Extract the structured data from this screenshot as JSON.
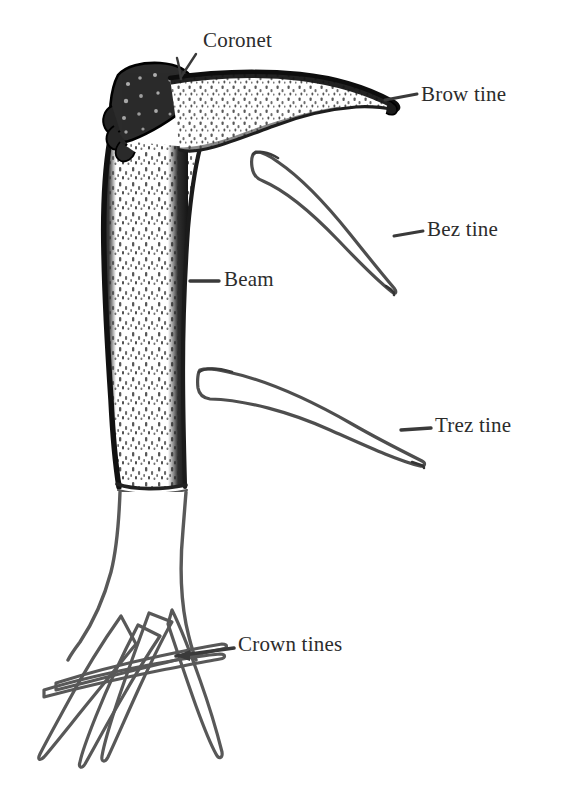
{
  "figure": {
    "background_color": "#ffffff",
    "ink_color": "#2c2c2c",
    "width": 571,
    "height": 805
  },
  "labels": {
    "coronet": "Coronet",
    "brow_tine": "Brow tine",
    "bez_tine": "Bez tine",
    "trez_tine": "Trez tine",
    "beam": "Beam",
    "crown_tines": "Crown tines"
  },
  "parts": [
    {
      "id": "coronet",
      "label": "Coronet",
      "leader_from": [
        196,
        55
      ],
      "leader_to": [
        181,
        78
      ]
    },
    {
      "id": "brow-tine",
      "label": "Brow tine",
      "leader_from": [
        414,
        94
      ],
      "leader_to": [
        383,
        101
      ]
    },
    {
      "id": "bez-tine",
      "label": "Bez tine",
      "leader_from": [
        421,
        231
      ],
      "leader_to": [
        394,
        236
      ]
    },
    {
      "id": "trez-tine",
      "label": "Trez tine",
      "leader_from": [
        428,
        428
      ],
      "leader_to": [
        400,
        430
      ]
    },
    {
      "id": "beam",
      "label": "Beam",
      "leader_from": [
        216,
        281
      ],
      "leader_to": [
        190,
        281
      ]
    },
    {
      "id": "crown-tines",
      "label": "Crown tines",
      "leader_from": [
        232,
        647
      ],
      "leader_to": [
        176,
        656
      ]
    }
  ]
}
